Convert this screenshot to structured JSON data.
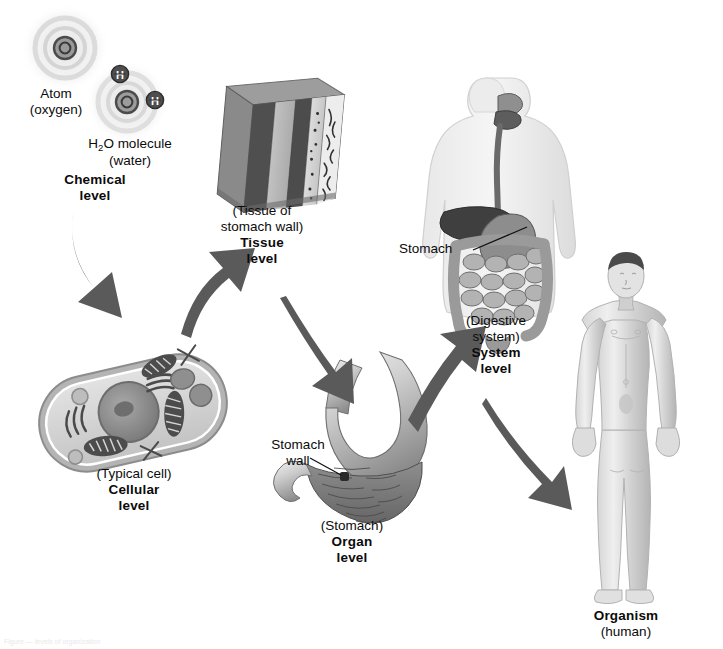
{
  "figure": {
    "background": "#ffffff",
    "arrow_color": "#5a5a5a"
  },
  "levels": [
    {
      "id": "chemical",
      "paren": "(water)",
      "bold_line1": "Chemical",
      "bold_line2": "level",
      "sublabels": [
        {
          "id": "atom",
          "line1": "Atom",
          "line2": "(oxygen)"
        },
        {
          "id": "molecule",
          "line1": "H2O molecule",
          "line2": "(water)"
        }
      ],
      "atom_symbol": "O",
      "hydrogen_symbol": "H"
    },
    {
      "id": "cellular",
      "paren": "(Typical cell)",
      "bold_line1": "Cellular",
      "bold_line2": "level"
    },
    {
      "id": "tissue",
      "paren_line1": "(Tissue of",
      "paren_line2": "stomach wall)",
      "bold_line1": "Tissue",
      "bold_line2": "level"
    },
    {
      "id": "organ",
      "paren": "(Stomach)",
      "bold_line1": "Organ",
      "bold_line2": "level",
      "callout_line1": "Stomach",
      "callout_line2": "wall"
    },
    {
      "id": "system",
      "paren_line1": "(Digestive",
      "paren_line2": "system)",
      "bold_line1": "System",
      "bold_line2": "level",
      "callout": "Stomach"
    },
    {
      "id": "organism",
      "bold_line1": "Organism",
      "paren": "(human)"
    }
  ],
  "arrows": [
    {
      "id": "chemical-to-cellular",
      "from": "chemical",
      "to": "cellular"
    },
    {
      "id": "cellular-to-tissue",
      "from": "cellular",
      "to": "tissue"
    },
    {
      "id": "tissue-to-organ",
      "from": "tissue",
      "to": "organ"
    },
    {
      "id": "organ-to-system",
      "from": "organ",
      "to": "system"
    },
    {
      "id": "system-to-organism",
      "from": "system",
      "to": "organism"
    }
  ],
  "caption": "Figure — levels of organization"
}
